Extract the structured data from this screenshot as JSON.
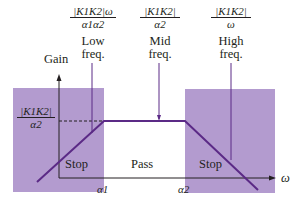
{
  "diagram": {
    "type": "band-pass filter gain plot",
    "y_axis_label": "Gain",
    "x_axis_label": "ω",
    "x_ticks": [
      "α1",
      "α2"
    ],
    "y_level_label": {
      "numerator": "|K1K2|",
      "denominator": "α2"
    },
    "regions": [
      {
        "label": "Stop",
        "shaded": true
      },
      {
        "label": "Pass",
        "shaded": false
      },
      {
        "label": "Stop",
        "shaded": true
      }
    ],
    "annotations": [
      {
        "numerator": "|K1K2|ω",
        "denominator": "α1α2",
        "label_line1": "Low",
        "label_line2": "freq."
      },
      {
        "numerator": "|K1K2|",
        "denominator": "α2",
        "label_line1": "Mid",
        "label_line2": "freq."
      },
      {
        "numerator": "|K1K2|",
        "denominator": "ω",
        "label_line1": "High",
        "label_line2": "freq."
      }
    ],
    "colors": {
      "shade": "#b39bcf",
      "curve": "#5b2a86",
      "axis": "#231f20"
    }
  }
}
